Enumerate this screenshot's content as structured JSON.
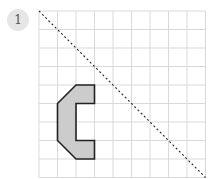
{
  "problem": {
    "number": "1"
  },
  "grid": {
    "origin_px": [
      39,
      11
    ],
    "cell_px": 18.5,
    "cols": 9,
    "rows": 9,
    "line_color": "#d9d9d9"
  },
  "mirror_line": {
    "from": [
      0,
      0
    ],
    "to": [
      9,
      9
    ],
    "style": "dotted",
    "color": "#333333"
  },
  "shape": {
    "points": [
      [
        1,
        5
      ],
      [
        2,
        4
      ],
      [
        3,
        4
      ],
      [
        3,
        5
      ],
      [
        2,
        5
      ],
      [
        2,
        7
      ],
      [
        3,
        7
      ],
      [
        3,
        8
      ],
      [
        2,
        8
      ],
      [
        1,
        7
      ]
    ],
    "fill": "#cccccc",
    "stroke": "#222222"
  }
}
